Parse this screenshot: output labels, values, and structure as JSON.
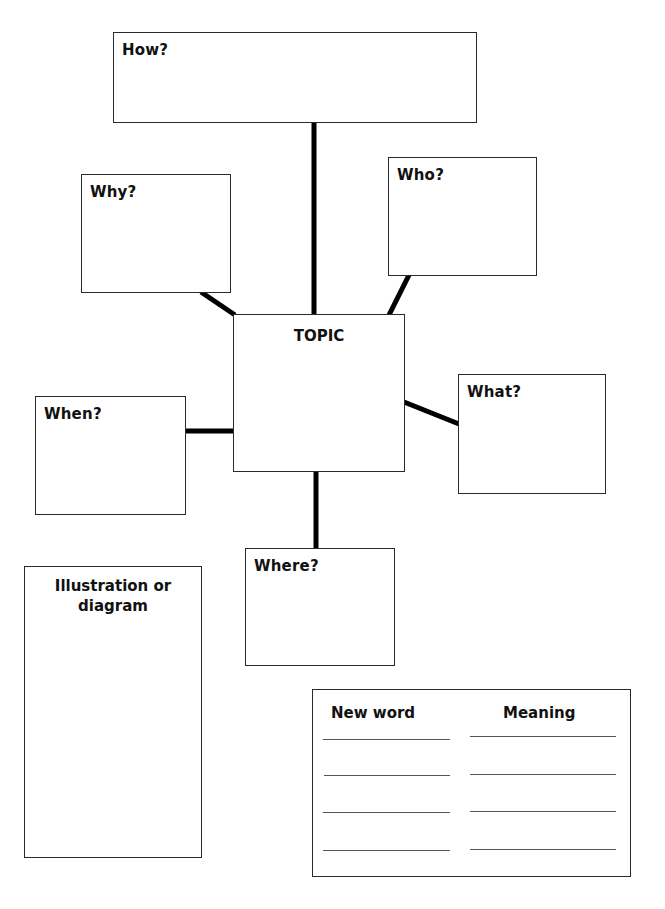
{
  "worksheet": {
    "center": {
      "label": "TOPIC"
    },
    "question_boxes": [
      {
        "id": "how",
        "label": "How?"
      },
      {
        "id": "why",
        "label": "Why?"
      },
      {
        "id": "who",
        "label": "Who?"
      },
      {
        "id": "when",
        "label": "When?"
      },
      {
        "id": "what",
        "label": "What?"
      },
      {
        "id": "where",
        "label": "Where?"
      }
    ],
    "illustration_box": {
      "label_line1": "Illustration or",
      "label_line2": "diagram"
    },
    "vocabulary": {
      "columns": [
        "New word",
        "Meaning"
      ],
      "rows": [
        {
          "new_word": "",
          "meaning": ""
        },
        {
          "new_word": "",
          "meaning": ""
        },
        {
          "new_word": "",
          "meaning": ""
        },
        {
          "new_word": "",
          "meaning": ""
        }
      ]
    }
  },
  "colors": {
    "line": "#000000",
    "border": "#2a2a2a",
    "background": "#ffffff"
  }
}
